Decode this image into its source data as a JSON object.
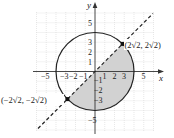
{
  "figure": {
    "type": "coordinate-plane-diagram",
    "axes": {
      "x_label": "x",
      "y_label": "y",
      "x_ticks": [
        "−5",
        "−3",
        "−2",
        "−1",
        "1",
        "2",
        "3",
        "5"
      ],
      "y_ticks": [
        "5",
        "3",
        "2",
        "1",
        "−1",
        "−2",
        "−3",
        "−5"
      ]
    },
    "circle": {
      "center": [
        0,
        0
      ],
      "radius": 4
    },
    "line": {
      "equation": "y = x",
      "style": "dashed"
    },
    "shaded_region": "half-disk below line y = x inside circle",
    "points": [
      {
        "label": "(2√2, 2√2)",
        "x": 2.828,
        "y": 2.828
      },
      {
        "label": "(−2√2, −2√2)",
        "x": -2.828,
        "y": -2.828
      }
    ],
    "colors": {
      "shade": "#d2d2d2",
      "grid": "#d8d8d8",
      "ink": "#222222"
    }
  }
}
